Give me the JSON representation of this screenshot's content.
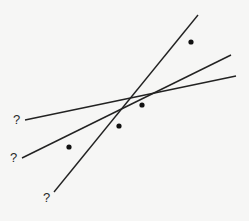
{
  "diagram": {
    "title": "",
    "colors": {
      "background": "#f6f6f5",
      "line": "#222222",
      "point": "#111111",
      "label": "#2a2a2a"
    },
    "points": [
      {
        "x": 69,
        "y": 147
      },
      {
        "x": 119,
        "y": 126
      },
      {
        "x": 142,
        "y": 105
      },
      {
        "x": 191,
        "y": 42
      }
    ],
    "lines": [
      {
        "id": "shallow",
        "x1": 25,
        "y1": 120,
        "x2": 236,
        "y2": 76,
        "label": "?",
        "label_x": 13,
        "label_y": 113
      },
      {
        "id": "medium",
        "x1": 22,
        "y1": 158,
        "x2": 231,
        "y2": 55,
        "label": "?",
        "label_x": 10,
        "label_y": 151
      },
      {
        "id": "steep",
        "x1": 54,
        "y1": 192,
        "x2": 198,
        "y2": 15,
        "label": "?",
        "label_x": 43,
        "label_y": 191
      }
    ]
  }
}
